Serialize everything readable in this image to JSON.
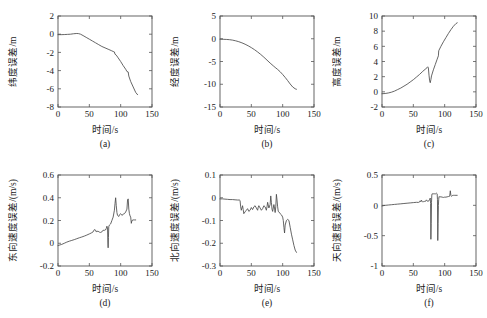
{
  "figure": {
    "background_color": "#ffffff",
    "curve_color": "#4a4a4a",
    "axis_color": "#555555",
    "rows": 2,
    "cols": 3
  },
  "chart_data": [
    {
      "type": "line",
      "panel_label": "(a)",
      "title": "",
      "xlabel": "时间/s",
      "ylabel": "纬度误差/m",
      "xlim": [
        0,
        150
      ],
      "ylim": [
        -8,
        2
      ],
      "xticks": [
        0,
        50,
        100,
        150
      ],
      "yticks": [
        -8,
        -6,
        -4,
        -2,
        0,
        2
      ],
      "grid": false,
      "legend": "none",
      "x": [
        0,
        5,
        10,
        15,
        20,
        25,
        30,
        33,
        36,
        40,
        45,
        50,
        55,
        60,
        65,
        70,
        75,
        80,
        85,
        88,
        90,
        91,
        93,
        96,
        100,
        104,
        108,
        110,
        112,
        113,
        116,
        120,
        124,
        127
      ],
      "y": [
        -0.05,
        -0.05,
        -0.04,
        -0.02,
        0.0,
        0.05,
        0.08,
        0.06,
        0.0,
        -0.15,
        -0.35,
        -0.55,
        -0.75,
        -0.95,
        -1.15,
        -1.35,
        -1.5,
        -1.65,
        -1.8,
        -1.9,
        -1.95,
        -2.2,
        -2.3,
        -2.6,
        -3.0,
        -3.45,
        -3.85,
        -4.1,
        -4.15,
        -4.6,
        -5.2,
        -5.8,
        -6.4,
        -6.65
      ]
    },
    {
      "type": "line",
      "panel_label": "(b)",
      "title": "",
      "xlabel": "时间/s",
      "ylabel": "经度误差/m",
      "xlim": [
        0,
        150
      ],
      "ylim": [
        -15,
        5
      ],
      "xticks": [
        0,
        50,
        100,
        150
      ],
      "yticks": [
        -15,
        -10,
        -5,
        0,
        5
      ],
      "grid": false,
      "legend": "none",
      "x": [
        0,
        5,
        10,
        15,
        20,
        25,
        30,
        35,
        40,
        45,
        50,
        55,
        60,
        65,
        70,
        75,
        80,
        85,
        88,
        92,
        96,
        100,
        104,
        108,
        112,
        116,
        120,
        122
      ],
      "y": [
        -0.1,
        -0.12,
        -0.15,
        -0.2,
        -0.3,
        -0.45,
        -0.65,
        -0.9,
        -1.2,
        -1.55,
        -1.95,
        -2.4,
        -2.9,
        -3.45,
        -4.05,
        -4.7,
        -5.35,
        -5.95,
        -6.3,
        -6.75,
        -7.25,
        -7.85,
        -8.5,
        -9.2,
        -9.95,
        -10.6,
        -11.0,
        -11.1
      ]
    },
    {
      "type": "line",
      "panel_label": "(c)",
      "title": "",
      "xlabel": "时间/s",
      "ylabel": "高度误差/m",
      "xlim": [
        0,
        150
      ],
      "ylim": [
        -2,
        10
      ],
      "xticks": [
        0,
        50,
        100,
        150
      ],
      "yticks": [
        -2,
        0,
        2,
        4,
        6,
        8,
        10
      ],
      "grid": false,
      "legend": "none",
      "x": [
        0,
        5,
        10,
        15,
        20,
        25,
        30,
        35,
        40,
        45,
        50,
        55,
        60,
        65,
        70,
        72,
        73,
        74,
        75,
        76,
        77,
        78,
        79,
        82,
        85,
        88,
        90,
        90.5,
        91,
        94,
        98,
        102,
        106,
        110,
        114,
        118,
        120
      ],
      "y": [
        -0.25,
        -0.22,
        -0.15,
        -0.05,
        0.1,
        0.3,
        0.5,
        0.75,
        1.0,
        1.3,
        1.6,
        1.95,
        2.3,
        2.7,
        3.05,
        3.2,
        3.3,
        3.15,
        2.2,
        1.45,
        1.2,
        1.6,
        2.1,
        2.9,
        3.6,
        4.3,
        4.75,
        5.4,
        5.5,
        6.0,
        6.6,
        7.15,
        7.7,
        8.2,
        8.65,
        9.0,
        9.1
      ]
    },
    {
      "type": "line",
      "panel_label": "(d)",
      "title": "",
      "xlabel": "时间/s",
      "ylabel": "东向速度误差/(m/s)",
      "xlim": [
        0,
        150
      ],
      "ylim": [
        -0.2,
        0.6
      ],
      "xticks": [
        0,
        50,
        100,
        150
      ],
      "yticks": [
        -0.2,
        0,
        0.2,
        0.4,
        0.6
      ],
      "grid": false,
      "legend": "none",
      "x": [
        0,
        3,
        6,
        10,
        14,
        18,
        22,
        26,
        30,
        34,
        38,
        42,
        46,
        50,
        53,
        56,
        58,
        60,
        61,
        62,
        64,
        66,
        68,
        70,
        72,
        74,
        75,
        76,
        77,
        78,
        79,
        79.5,
        80,
        80.5,
        81,
        82,
        83,
        84,
        86,
        88,
        90,
        91,
        92,
        93,
        94,
        95,
        96,
        97,
        98,
        100,
        102,
        104,
        106,
        108,
        110,
        111,
        112,
        113,
        114,
        115,
        116,
        117,
        118,
        120,
        122,
        124
      ],
      "y": [
        -0.02,
        -0.015,
        -0.01,
        0.0,
        0.01,
        0.018,
        0.025,
        0.032,
        0.04,
        0.048,
        0.055,
        0.063,
        0.072,
        0.082,
        0.09,
        0.1,
        0.12,
        0.115,
        0.1,
        0.105,
        0.105,
        0.098,
        0.095,
        0.1,
        0.115,
        0.112,
        0.12,
        0.118,
        0.13,
        0.15,
        0.14,
        0.02,
        -0.04,
        0.05,
        0.145,
        0.16,
        0.165,
        0.17,
        0.2,
        0.23,
        0.29,
        0.35,
        0.4,
        0.33,
        0.27,
        0.245,
        0.24,
        0.235,
        0.25,
        0.26,
        0.245,
        0.255,
        0.26,
        0.275,
        0.3,
        0.38,
        0.39,
        0.3,
        0.26,
        0.24,
        0.23,
        0.175,
        0.2,
        0.205,
        0.205,
        0.205
      ]
    },
    {
      "type": "line",
      "panel_label": "(e)",
      "title": "",
      "xlabel": "时间/s",
      "ylabel": "北向速度误差/(m/s)",
      "xlim": [
        0,
        150
      ],
      "ylim": [
        -0.3,
        0.1
      ],
      "xticks": [
        0,
        50,
        100,
        150
      ],
      "yticks": [
        -0.3,
        -0.2,
        -0.1,
        0,
        0.1
      ],
      "grid": false,
      "legend": "none",
      "x": [
        0,
        4,
        8,
        12,
        16,
        20,
        24,
        28,
        31,
        32,
        33,
        34,
        35,
        36,
        37,
        38,
        40,
        42,
        44,
        46,
        48,
        50,
        52,
        54,
        56,
        58,
        60,
        61,
        62,
        64,
        66,
        68,
        70,
        72,
        74,
        75,
        76,
        78,
        80,
        81,
        82,
        83,
        84,
        85,
        86,
        87,
        88,
        89,
        90,
        91,
        92,
        93,
        94,
        96,
        98,
        100,
        101,
        102,
        103,
        104,
        106,
        108,
        110,
        112,
        114,
        116,
        118,
        120,
        122
      ],
      "y": [
        -0.005,
        -0.005,
        -0.006,
        -0.007,
        -0.008,
        -0.008,
        -0.009,
        -0.01,
        -0.01,
        -0.012,
        -0.04,
        -0.055,
        -0.045,
        -0.035,
        -0.052,
        -0.07,
        -0.062,
        -0.055,
        -0.048,
        -0.06,
        -0.055,
        -0.043,
        -0.052,
        -0.04,
        -0.035,
        -0.045,
        -0.055,
        -0.042,
        -0.035,
        -0.045,
        -0.055,
        -0.048,
        -0.035,
        -0.04,
        -0.055,
        -0.04,
        -0.02,
        -0.045,
        -0.03,
        0.008,
        -0.02,
        -0.05,
        -0.06,
        -0.045,
        -0.03,
        -0.045,
        -0.065,
        -0.04,
        0.015,
        -0.01,
        -0.04,
        -0.06,
        -0.062,
        -0.07,
        -0.075,
        -0.085,
        -0.1,
        -0.13,
        -0.155,
        -0.12,
        -0.1,
        -0.095,
        -0.1,
        -0.13,
        -0.16,
        -0.185,
        -0.21,
        -0.23,
        -0.24
      ]
    },
    {
      "type": "line",
      "panel_label": "(f)",
      "title": "",
      "xlabel": "时间/s",
      "ylabel": "天向速度误差/(m/s)",
      "xlim": [
        0,
        150
      ],
      "ylim": [
        -1,
        0.5
      ],
      "xticks": [
        0,
        50,
        100,
        150
      ],
      "yticks": [
        -1,
        -0.5,
        0,
        0.5
      ],
      "grid": false,
      "legend": "none",
      "x": [
        0,
        5,
        10,
        15,
        20,
        25,
        30,
        35,
        40,
        45,
        50,
        55,
        58,
        60,
        61,
        62,
        63,
        64,
        65,
        66,
        68,
        70,
        71,
        72,
        73,
        74,
        75,
        76,
        77,
        77.5,
        78,
        78.5,
        79,
        79.5,
        80,
        81,
        82,
        83,
        84,
        85,
        86,
        87,
        88,
        88.5,
        89,
        89.5,
        90,
        90.5,
        91,
        92,
        94,
        96,
        98,
        100,
        102,
        104,
        106,
        108,
        109,
        110,
        111,
        112,
        114,
        116,
        118,
        120
      ],
      "y": [
        -0.01,
        0.0,
        0.005,
        0.01,
        0.015,
        0.02,
        0.025,
        0.03,
        0.035,
        0.04,
        0.045,
        0.05,
        0.048,
        0.055,
        0.075,
        0.06,
        0.085,
        0.065,
        0.055,
        0.06,
        0.065,
        0.07,
        0.09,
        0.075,
        0.065,
        0.07,
        0.075,
        0.1,
        0.12,
        0.03,
        -0.56,
        -0.3,
        0.05,
        0.17,
        0.19,
        0.19,
        0.19,
        0.19,
        0.19,
        0.19,
        0.19,
        0.2,
        0.19,
        0.1,
        -0.58,
        -0.3,
        0.0,
        0.1,
        0.145,
        0.14,
        0.14,
        0.135,
        0.13,
        0.135,
        0.135,
        0.14,
        0.145,
        0.15,
        0.24,
        0.16,
        0.15,
        0.16,
        0.165,
        0.165,
        0.165,
        0.165
      ]
    }
  ]
}
